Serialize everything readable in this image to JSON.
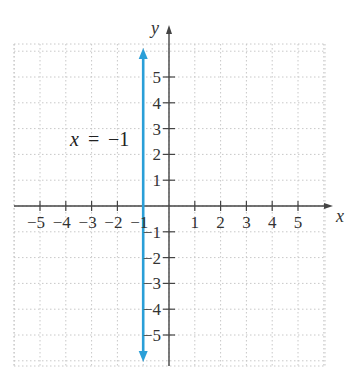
{
  "chart_data": {
    "type": "line",
    "title": "",
    "xlabel": "x",
    "ylabel": "y",
    "xlim": [
      -6,
      6
    ],
    "ylim": [
      -6,
      6
    ],
    "grid": true,
    "x_ticks": [
      -5,
      -4,
      -3,
      -2,
      -1,
      1,
      2,
      3,
      4,
      5
    ],
    "y_ticks": [
      -5,
      -4,
      -3,
      -2,
      -1,
      1,
      2,
      3,
      4,
      5
    ],
    "x_tick_labels": [
      "−5",
      "−4",
      "−3",
      "−2",
      "−1",
      "1",
      "2",
      "3",
      "4",
      "5"
    ],
    "y_tick_labels": [
      "−5",
      "−4",
      "−3",
      "−2",
      "−1",
      "1",
      "2",
      "3",
      "4",
      "5"
    ],
    "series": [
      {
        "name": "x = −1",
        "kind": "vertical-line",
        "x": [
          -1,
          -1
        ],
        "y": [
          -5.8,
          5.8
        ],
        "arrows": "both",
        "color": "#2a9fd8"
      }
    ],
    "annotations": [
      {
        "text": "x = −1",
        "x": -3.7,
        "y": 2.5
      }
    ]
  },
  "labels": {
    "x_axis": "x",
    "y_axis": "y",
    "equation_lhs": "x",
    "equation_eq": "=",
    "equation_rhs": "−1"
  },
  "colors": {
    "line": "#2a9fd8",
    "axis": "#444444",
    "grid": "#c8c8c8"
  }
}
